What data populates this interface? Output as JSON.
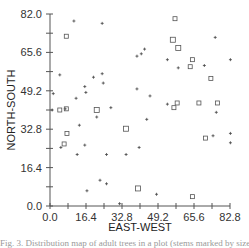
{
  "chart_data": {
    "type": "scatter",
    "title": "",
    "xlabel": "EAST-WEST",
    "ylabel": "NORTH-SOUTH",
    "xlim": [
      0.0,
      82.8
    ],
    "ylim": [
      0.0,
      82.0
    ],
    "x_ticks": [
      "0.0",
      "16.4",
      "32.8",
      "49.2",
      "65.6",
      "82.8"
    ],
    "y_ticks": [
      "0.0",
      "16.4",
      "32.8",
      "49.2",
      "65.6",
      "82.0"
    ],
    "grid": false,
    "legend": null,
    "series": [
      {
        "name": "plus",
        "marker": "+",
        "points": [
          [
            11.0,
            79.0
          ],
          [
            24.0,
            78.0
          ],
          [
            76.0,
            72.0
          ],
          [
            83.0,
            62.5
          ],
          [
            71.0,
            60.0
          ],
          [
            43.5,
            67.0
          ],
          [
            42.0,
            65.0
          ],
          [
            40.0,
            64.0
          ],
          [
            4.5,
            56.0
          ],
          [
            1.5,
            48.0
          ],
          [
            12.0,
            46.0
          ],
          [
            7.0,
            41.5
          ],
          [
            16.0,
            51.0
          ],
          [
            16.5,
            48.5
          ],
          [
            20.0,
            55.0
          ],
          [
            24.0,
            56.5
          ],
          [
            24.5,
            52.5
          ],
          [
            1.0,
            41.0
          ],
          [
            21.5,
            38.0
          ],
          [
            13.5,
            34.5
          ],
          [
            28.0,
            42.0
          ],
          [
            46.0,
            47.0
          ],
          [
            40.0,
            50.0
          ],
          [
            59.0,
            59.0
          ],
          [
            83.0,
            31.0
          ],
          [
            76.5,
            40.0
          ],
          [
            75.0,
            30.0
          ],
          [
            5.0,
            25.0
          ],
          [
            16.0,
            26.0
          ],
          [
            26.0,
            22.0
          ],
          [
            35.0,
            22.0
          ],
          [
            12.5,
            22.0
          ],
          [
            23.0,
            11.0
          ],
          [
            26.0,
            9.5
          ],
          [
            17.0,
            6.5
          ],
          [
            32.0,
            1.0
          ],
          [
            49.0,
            5.0
          ],
          [
            54.0,
            62.5
          ],
          [
            83.0,
            27.0
          ],
          [
            44.5,
            37.0
          ],
          [
            41.0,
            25.0
          ],
          [
            54.0,
            43.5
          ]
        ]
      },
      {
        "name": "square",
        "marker": "square",
        "points": [
          [
            7.5,
            72.5,
            4
          ],
          [
            4.5,
            41.0,
            4
          ],
          [
            7.5,
            41.5,
            4
          ],
          [
            21.5,
            41.0,
            5
          ],
          [
            7.8,
            31.0,
            4
          ],
          [
            6.5,
            26.5,
            4
          ],
          [
            35.0,
            33.0,
            5
          ],
          [
            40.5,
            7.5,
            5
          ],
          [
            57.5,
            80.0,
            4
          ],
          [
            56.5,
            71.0,
            5
          ],
          [
            59.0,
            67.5,
            5
          ],
          [
            65.5,
            62.5,
            4
          ],
          [
            74.0,
            54.5,
            4
          ],
          [
            64.5,
            59.5,
            4
          ],
          [
            58.5,
            44.0,
            4
          ],
          [
            68.5,
            44.0,
            4
          ],
          [
            57.0,
            42.0,
            4
          ],
          [
            77.0,
            44.0,
            4
          ],
          [
            71.5,
            29.0,
            4
          ],
          [
            65.5,
            4.0,
            4
          ]
        ]
      }
    ]
  },
  "caption": "Fig. 3. Distribution map of adult trees in a plot (stems marked by size)"
}
